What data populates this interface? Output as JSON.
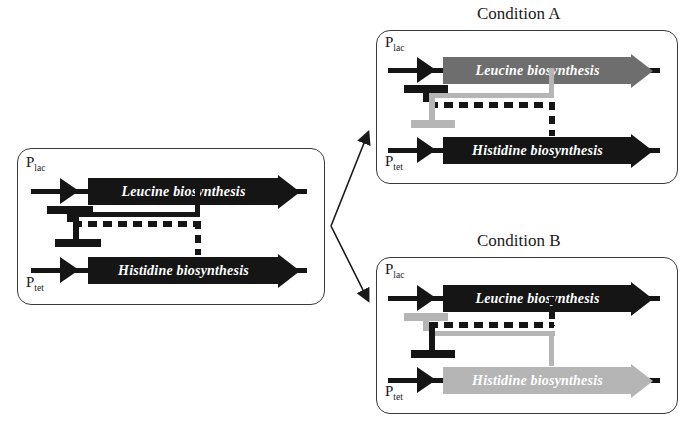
{
  "figure": {
    "type": "genetic-toggle-switch-diagram"
  },
  "colors": {
    "active_dark": "#151515",
    "medium_gray": "#6e6e6e",
    "light_gray": "#b5b5b5",
    "panel_border": "#3a3a3a",
    "text_on_arrow": "#ffffff",
    "background": "#ffffff"
  },
  "panels": [
    {
      "id": "base",
      "title": "",
      "promoters": [
        {
          "name": "P",
          "subscript": "lac",
          "state": "active"
        },
        {
          "name": "P",
          "subscript": "tet",
          "state": "active"
        }
      ],
      "genes": [
        {
          "label": "Leucine biosynthesis",
          "state": "active",
          "color": "#151515"
        },
        {
          "label": "Histidine biosynthesis",
          "state": "active",
          "color": "#151515"
        }
      ],
      "repressors": [
        {
          "from": "Histidine biosynthesis",
          "to": "P lac",
          "style": "dashed",
          "color": "#151515"
        },
        {
          "from": "Leucine biosynthesis",
          "to": "P tet",
          "style": "solid",
          "color": "#151515"
        }
      ]
    },
    {
      "id": "condition-a",
      "title": "Condition A",
      "promoters": [
        {
          "name": "P",
          "subscript": "lac",
          "state": "repressed"
        },
        {
          "name": "P",
          "subscript": "tet",
          "state": "active"
        }
      ],
      "genes": [
        {
          "label": "Leucine biosynthesis",
          "state": "repressed",
          "color": "#6e6e6e"
        },
        {
          "label": "Histidine biosynthesis",
          "state": "active",
          "color": "#151515"
        }
      ],
      "repressors": [
        {
          "from": "Histidine biosynthesis",
          "to": "P lac",
          "style": "dashed",
          "color": "#151515",
          "state": "active"
        },
        {
          "from": "Leucine biosynthesis",
          "to": "P tet",
          "style": "solid",
          "color": "#b5b5b5",
          "state": "inactive"
        }
      ]
    },
    {
      "id": "condition-b",
      "title": "Condition B",
      "promoters": [
        {
          "name": "P",
          "subscript": "lac",
          "state": "active"
        },
        {
          "name": "P",
          "subscript": "tet",
          "state": "repressed"
        }
      ],
      "genes": [
        {
          "label": "Leucine biosynthesis",
          "state": "active",
          "color": "#151515"
        },
        {
          "label": "Histidine biosynthesis",
          "state": "repressed",
          "color": "#b5b5b5"
        }
      ],
      "repressors": [
        {
          "from": "Histidine biosynthesis",
          "to": "P lac",
          "style": "solid",
          "color": "#b5b5b5",
          "state": "inactive"
        },
        {
          "from": "Leucine biosynthesis",
          "to": "P tet",
          "style": "dashed",
          "color": "#151515",
          "state": "active"
        }
      ]
    }
  ],
  "branch_arrows": [
    {
      "from": "base",
      "to": "condition-a",
      "direction": "up-right"
    },
    {
      "from": "base",
      "to": "condition-b",
      "direction": "down-right"
    }
  ]
}
